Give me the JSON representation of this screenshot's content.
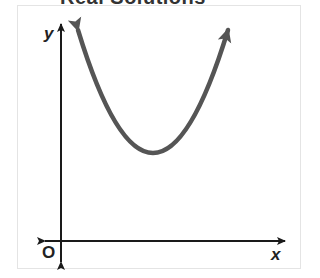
{
  "title": "Real Solutions",
  "graph": {
    "x_label": "x",
    "y_label": "y",
    "origin_label": "O",
    "curve": "upward-opening parabola with vertex above x-axis (no real roots)",
    "curve_color": "#555555",
    "axis_color": "#1a1a1a"
  }
}
